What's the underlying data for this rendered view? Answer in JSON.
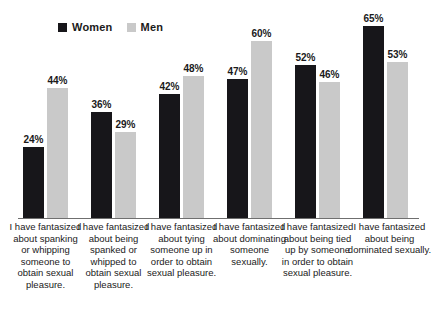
{
  "chart_data": {
    "type": "bar",
    "title": "",
    "subtitle": "",
    "xlabel": "",
    "ylabel": "",
    "ylim": [
      0,
      70
    ],
    "grid": false,
    "legend_position": "top-left",
    "value_labels": true,
    "value_suffix": "%",
    "categories": [
      "I have fantasized about spanking or whipping someone to obtain sexual pleasure.",
      "I have fantasized about being spanked or whipped to obtain sexual pleasure.",
      "I have fantasized about tying someone up in order to obtain sexual pleasure.",
      "I have fantasized about dominating someone sexually.",
      "I have fantasized about being tied up by someone in order to obtain sexual pleasure.",
      "I have fantasized about being dominated sexually."
    ],
    "series": [
      {
        "name": "Women",
        "color": "#17161a",
        "values": [
          24,
          36,
          42,
          47,
          52,
          65
        ],
        "labels": [
          "24%",
          "36%",
          "42%",
          "47%",
          "52%",
          "65%"
        ]
      },
      {
        "name": "Men",
        "color": "#c9c9c9",
        "values": [
          44,
          29,
          48,
          60,
          46,
          53
        ],
        "labels": [
          "44%",
          "29%",
          "48%",
          "60%",
          "46%",
          "53%"
        ]
      }
    ]
  },
  "legend": {
    "entries": [
      {
        "label": "Women",
        "color": "#17161a",
        "swatch_icon": "legend-square-icon"
      },
      {
        "label": "Men",
        "color": "#c9c9c9",
        "swatch_icon": "legend-square-icon"
      }
    ]
  },
  "axis": {
    "baseline_color": "#6f6f6f"
  },
  "colors": {
    "women": "#17161a",
    "men": "#c9c9c9",
    "background": "#ffffff",
    "text": "#1a1a1a"
  }
}
